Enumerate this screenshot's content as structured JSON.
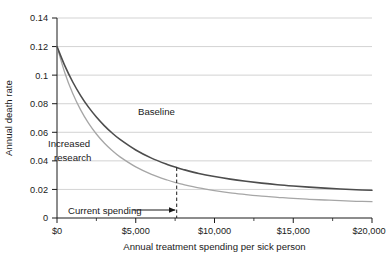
{
  "chart_data": {
    "type": "line",
    "title": "",
    "xlabel": "Annual treatment spending per sick person",
    "ylabel": "Annual death rate",
    "xlim": [
      0,
      20000
    ],
    "ylim": [
      0,
      0.14
    ],
    "grid": true,
    "grid_axis": "y",
    "legend_position": "inline-annotation",
    "x_tick_labels": [
      "$0",
      "$5,000",
      "$10,000",
      "$15,000",
      "$20,000"
    ],
    "x_tick_values": [
      0,
      5000,
      10000,
      15000,
      20000
    ],
    "y_tick_labels": [
      "0",
      "0.02",
      "0.04",
      "0.06",
      "0.08",
      "0.1",
      "0.12",
      "0.14"
    ],
    "y_tick_values": [
      0,
      0.02,
      0.04,
      0.06,
      0.08,
      0.1,
      0.12,
      0.14
    ],
    "x": [
      0,
      500,
      1000,
      1500,
      2000,
      2500,
      3000,
      3500,
      4000,
      5000,
      6000,
      7000,
      7600,
      8000,
      9000,
      10000,
      11000,
      12000,
      13000,
      14000,
      15000,
      16000,
      17000,
      18000,
      19000,
      20000
    ],
    "series": [
      {
        "name": "Baseline",
        "color": "#4d4d4d",
        "line_width": 1.6,
        "values": [
          0.12,
          0.1065,
          0.0952,
          0.0857,
          0.0776,
          0.0707,
          0.0647,
          0.0595,
          0.055,
          0.0476,
          0.0419,
          0.0375,
          0.0353,
          0.034,
          0.0312,
          0.029,
          0.0272,
          0.0257,
          0.0244,
          0.0233,
          0.0224,
          0.0216,
          0.0209,
          0.0203,
          0.0198,
          0.0194
        ]
      },
      {
        "name": "Increased research",
        "color": "#a6a6a6",
        "line_width": 1.3,
        "values": [
          0.12,
          0.1015,
          0.0871,
          0.0757,
          0.0664,
          0.0588,
          0.0525,
          0.0472,
          0.0428,
          0.0358,
          0.0306,
          0.0266,
          0.0246,
          0.0235,
          0.0211,
          0.0192,
          0.0176,
          0.0164,
          0.0153,
          0.0145,
          0.0137,
          0.0131,
          0.0126,
          0.0121,
          0.0117,
          0.0114
        ]
      }
    ],
    "annotations": [
      {
        "name": "baseline-label",
        "text": "Baseline",
        "x": 5150,
        "y": 0.0685
      },
      {
        "name": "increased-research-label-line1",
        "text": "Increased",
        "x": 300,
        "y": 0.0525
      },
      {
        "name": "increased-research-label-line2",
        "text": "research",
        "x": 700,
        "y": 0.0415
      },
      {
        "name": "current-spending-label",
        "text": "Current spending",
        "x": 1150,
        "y": 0.0075,
        "marker_x": 7600,
        "marker_y_top": 0.0353,
        "marker_y_bottom": 0
      }
    ]
  }
}
